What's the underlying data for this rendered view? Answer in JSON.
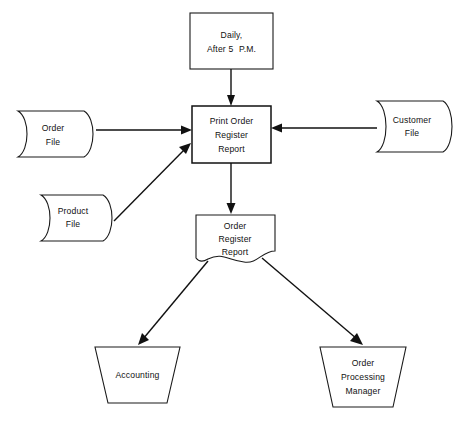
{
  "diagram": {
    "type": "system-flowchart",
    "colors": {
      "background": "#ffffff",
      "stroke": "#111111",
      "shape_fill": "#ffffff",
      "text": "#111111"
    },
    "nodes": [
      {
        "id": "schedule",
        "shape": "rectangle",
        "role": "timing-annotation",
        "lines": [
          "Daily,",
          "After 5 P.M."
        ],
        "line1": "Daily,",
        "line2_main": "After 5",
        "line2_small": "P.M."
      },
      {
        "id": "order-file",
        "shape": "magnetic-tape-file",
        "role": "input-file",
        "lines": [
          "Order",
          "File"
        ],
        "line1": "Order",
        "line2": "File"
      },
      {
        "id": "customer-file",
        "shape": "magnetic-tape-file",
        "role": "input-file",
        "lines": [
          "Customer",
          "File"
        ],
        "line1": "Customer",
        "line2": "File"
      },
      {
        "id": "product-file",
        "shape": "magnetic-tape-file",
        "role": "input-file",
        "lines": [
          "Product",
          "File"
        ],
        "line1": "Product",
        "line2": "File"
      },
      {
        "id": "process",
        "shape": "rectangle",
        "role": "computer-process",
        "lines": [
          "Print  Order",
          "Register",
          "Report"
        ],
        "line1": "Print  Order",
        "line2": "Register",
        "line3": "Report"
      },
      {
        "id": "report-document",
        "shape": "document",
        "role": "printed-output",
        "lines": [
          "Order",
          "Register",
          "Report"
        ],
        "line1": "Order",
        "line2": "Register",
        "line3": "Report"
      },
      {
        "id": "accounting",
        "shape": "trapezoid",
        "role": "destination",
        "lines": [
          "Accounting"
        ],
        "line1": "Accounting"
      },
      {
        "id": "order-processing-manager",
        "shape": "trapezoid",
        "role": "destination",
        "lines": [
          "Order",
          "Processing",
          "Manager"
        ],
        "line1": "Order",
        "line2": "Processing",
        "line3": "Manager"
      }
    ],
    "edges": [
      {
        "id": "schedule-to-process",
        "from": "schedule",
        "to": "process",
        "direction": "down",
        "style": "straight-line-arrow"
      },
      {
        "id": "order-file-to-process",
        "from": "order-file",
        "to": "process",
        "direction": "right",
        "style": "straight-line-arrow"
      },
      {
        "id": "customer-file-to-process",
        "from": "customer-file",
        "to": "process",
        "direction": "left",
        "style": "straight-line-arrow"
      },
      {
        "id": "product-file-to-process",
        "from": "product-file",
        "to": "process",
        "direction": "up-right",
        "style": "diagonal-line-arrow"
      },
      {
        "id": "process-to-report",
        "from": "process",
        "to": "report-document",
        "direction": "down",
        "style": "straight-line-arrow"
      },
      {
        "id": "report-to-accounting",
        "from": "report-document",
        "to": "accounting",
        "direction": "down-left",
        "style": "diagonal-line-arrow"
      },
      {
        "id": "report-to-manager",
        "from": "report-document",
        "to": "order-processing-manager",
        "direction": "down-right",
        "style": "diagonal-line-arrow"
      }
    ]
  }
}
